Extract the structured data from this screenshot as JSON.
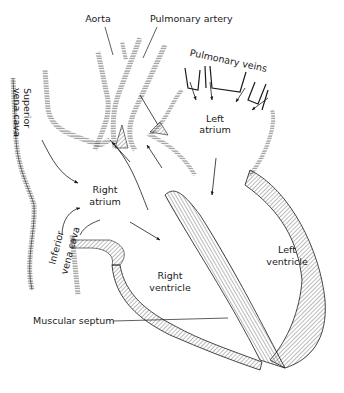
{
  "diagram": {
    "colors": {
      "ink": "#1a1a1a",
      "background": "#ffffff",
      "hatch": "#555555"
    },
    "labels": {
      "aorta": "Aorta",
      "pulmonary_artery": "Pulmonary artery",
      "pulmonary_veins": "Pulmonary veins",
      "superior_vena_cava_1": "Superior",
      "superior_vena_cava_2": "vena cava",
      "left_atrium_1": "Left",
      "left_atrium_2": "atrium",
      "right_atrium_1": "Right",
      "right_atrium_2": "atrium",
      "inferior_vena_cava_1": "Inferior",
      "inferior_vena_cava_2": "vena cava",
      "left_ventricle_1": "Left",
      "left_ventricle_2": "ventricle",
      "right_ventricle_1": "Right",
      "right_ventricle_2": "ventricle",
      "muscular_septum": "Muscular septum"
    }
  }
}
